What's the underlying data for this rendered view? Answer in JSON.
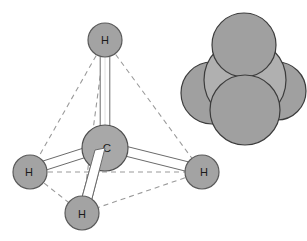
{
  "figure": {
    "background_color": "#ffffff",
    "width": 307,
    "height": 241
  },
  "colors": {
    "atom_fill": "#a3a3a3",
    "atom_stroke": "#5a5a5a",
    "carbon_fill": "#a8a8a8",
    "carbon_stroke": "#4f4f4f",
    "bond_fill": "#ffffff",
    "bond_stroke": "#6b6b6b",
    "dashed_edge": "#9a9a9a",
    "spacefill_h_fill": "#a0a0a0",
    "spacefill_c_fill": "#b0b0b0",
    "spacefill_stroke": "#3c3c3c",
    "label_text": "#1a1a1a"
  },
  "ball_and_stick": {
    "name": "ball-and-stick model of methane",
    "center_atom": {
      "label": "C",
      "element_name": "carbon",
      "cx": 105,
      "cy": 148,
      "r": 23
    },
    "hydrogens": [
      {
        "label": "H",
        "position_name": "top",
        "cx": 105,
        "cy": 40,
        "r": 17
      },
      {
        "label": "H",
        "position_name": "left",
        "cx": 30,
        "cy": 172,
        "r": 17
      },
      {
        "label": "H",
        "position_name": "right",
        "cx": 202,
        "cy": 172,
        "r": 17
      },
      {
        "label": "H",
        "position_name": "bottom",
        "cx": 82,
        "cy": 213,
        "r": 17
      }
    ],
    "bond_count": 4,
    "tetrahedron_edges": 6,
    "edge_style": "dashed"
  },
  "space_filling": {
    "name": "space-filling model of methane",
    "spheres": [
      {
        "element_name": "hydrogen",
        "position_name": "back-left",
        "cx": 212,
        "cy": 93,
        "r": 31
      },
      {
        "element_name": "hydrogen",
        "position_name": "back-right",
        "cx": 277,
        "cy": 91,
        "r": 29
      },
      {
        "element_name": "carbon",
        "position_name": "center",
        "cx": 245,
        "cy": 80,
        "r": 41
      },
      {
        "element_name": "hydrogen",
        "position_name": "top",
        "cx": 244,
        "cy": 45,
        "r": 32
      },
      {
        "element_name": "hydrogen",
        "position_name": "front",
        "cx": 245,
        "cy": 110,
        "r": 35
      }
    ]
  }
}
